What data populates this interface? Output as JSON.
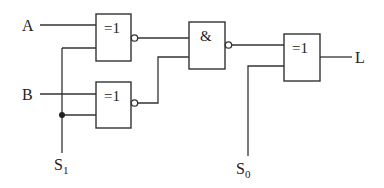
{
  "diagram": {
    "type": "logic-circuit",
    "inputs": {
      "a": "A",
      "b": "B",
      "s1": "S",
      "s1_sub": "1",
      "s0": "S",
      "s0_sub": "0"
    },
    "output": "L",
    "gates": {
      "xnor_top": {
        "symbol": "=1",
        "kind": "XNOR",
        "inputs": [
          "A",
          "S1"
        ]
      },
      "xnor_bottom": {
        "symbol": "=1",
        "kind": "XNOR",
        "inputs": [
          "B",
          "S1"
        ]
      },
      "nand": {
        "symbol": "&",
        "kind": "NAND",
        "inputs": [
          "xnor_top",
          "xnor_bottom"
        ]
      },
      "xor_out": {
        "symbol": "=1",
        "kind": "XOR",
        "inputs": [
          "nand",
          "S0"
        ]
      }
    },
    "colors": {
      "stroke": "#333333",
      "background": "#ffffff"
    }
  }
}
